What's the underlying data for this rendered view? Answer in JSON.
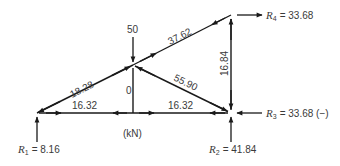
{
  "diagram": {
    "units_label": "(kN)",
    "applied_load": {
      "label": "50",
      "direction": "down"
    },
    "members": [
      {
        "id": "left-diagonal",
        "label": "18.28"
      },
      {
        "id": "top-chord",
        "label": "37.62"
      },
      {
        "id": "right-vertical",
        "label": "16.84"
      },
      {
        "id": "center-diagonal",
        "label": "55.90"
      },
      {
        "id": "center-vertical",
        "label": "0"
      },
      {
        "id": "bottom-chord-left",
        "label": "16.32"
      },
      {
        "id": "bottom-chord-right",
        "label": "16.32"
      }
    ],
    "reactions": {
      "r1": {
        "symbol": "R",
        "sub": "1",
        "value": "= 8.16"
      },
      "r2": {
        "symbol": "R",
        "sub": "2",
        "value": "= 41.84"
      },
      "r3": {
        "symbol": "R",
        "sub": "3",
        "value": "= 33.68 (−)"
      },
      "r4": {
        "symbol": "R",
        "sub": "4",
        "value": "= 33.68"
      }
    },
    "colors": {
      "line": "#1a1a1a",
      "text": "#3a3a3a",
      "background": "#ffffff"
    }
  }
}
